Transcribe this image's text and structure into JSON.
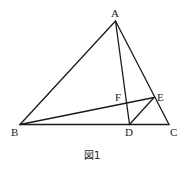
{
  "figure": {
    "caption": "図1",
    "points": {
      "A": {
        "label": "A",
        "x": 115.5,
        "y": 21
      },
      "B": {
        "label": "B",
        "x": 20,
        "y": 124.5
      },
      "C": {
        "label": "C",
        "x": 169,
        "y": 124.5
      },
      "D": {
        "label": "D",
        "x": 129.5,
        "y": 124.5
      },
      "E": {
        "label": "E",
        "x": 154,
        "y": 97.5
      },
      "F": {
        "label": "F",
        "x": 126.5,
        "y": 103
      }
    },
    "segments": [
      {
        "from": "A",
        "to": "B"
      },
      {
        "from": "A",
        "to": "C"
      },
      {
        "from": "B",
        "to": "C"
      },
      {
        "from": "A",
        "to": "D"
      },
      {
        "from": "B",
        "to": "E"
      },
      {
        "from": "D",
        "to": "E"
      }
    ],
    "colors": {
      "line": "#1a1a1a",
      "text": "#222222",
      "background": "#ffffff"
    }
  }
}
